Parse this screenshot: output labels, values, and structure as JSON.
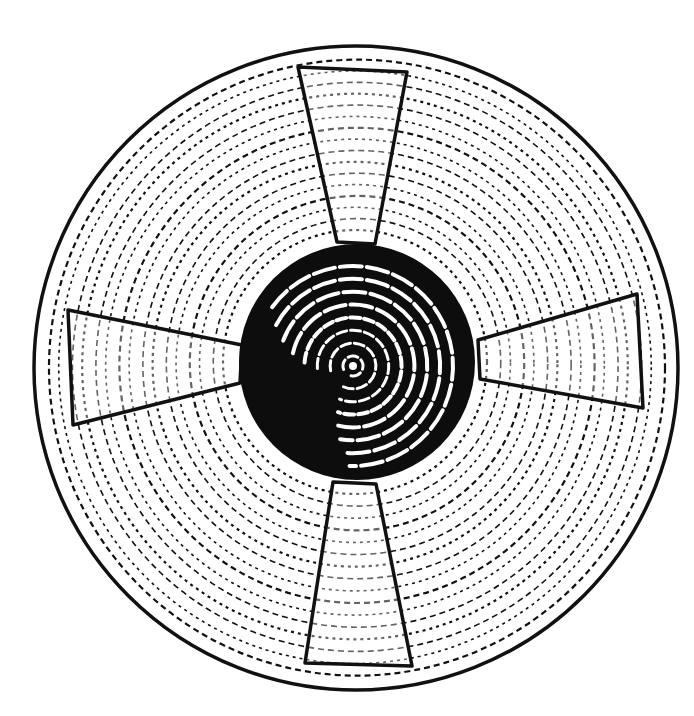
{
  "figure": {
    "colors": {
      "ink": "#111111",
      "paper": "#ffffff"
    },
    "outline": {
      "cx": 356,
      "cy": 368,
      "r": 322
    },
    "heartwood": {
      "cx": 357,
      "cy": 362,
      "r": 118
    },
    "rings": {
      "count": 16,
      "r_start": 132,
      "r_end": 308
    },
    "core_rings": {
      "count": 8,
      "r_start": 10,
      "r_end": 100
    },
    "wedges": [
      {
        "name": "top",
        "points": "298,67 407,72 375,244 337,242"
      },
      {
        "name": "right",
        "points": "478,340 637,294 643,408 480,379"
      },
      {
        "name": "bottom",
        "points": "333,482 376,484 412,666 305,663"
      },
      {
        "name": "left",
        "points": "242,345 68,310 73,425 240,383"
      }
    ]
  }
}
